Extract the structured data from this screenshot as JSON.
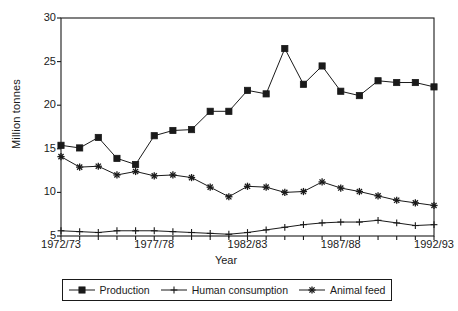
{
  "chart_data": {
    "type": "line",
    "title": "",
    "xlabel": "Year",
    "ylabel": "Million tonnes",
    "ylim": [
      5,
      30
    ],
    "yticks": [
      5,
      10,
      15,
      20,
      25,
      30
    ],
    "grid": false,
    "legend_position": "bottom",
    "x": [
      "1972/73",
      "1973/74",
      "1974/75",
      "1975/76",
      "1976/77",
      "1977/78",
      "1978/79",
      "1979/80",
      "1980/81",
      "1981/82",
      "1982/83",
      "1983/84",
      "1984/85",
      "1985/86",
      "1986/87",
      "1987/88",
      "1988/89",
      "1989/90",
      "1990/91",
      "1991/92",
      "1992/93"
    ],
    "xtick_labels": [
      "1972/73",
      "1977/78",
      "1982/83",
      "1987/88",
      "1992/93"
    ],
    "xtick_indices": [
      0,
      5,
      10,
      15,
      20
    ],
    "series": [
      {
        "name": "Production",
        "marker": "square",
        "color": "#1a1a1a",
        "values": [
          15.4,
          15.1,
          16.3,
          13.9,
          13.2,
          16.5,
          17.1,
          17.2,
          19.3,
          19.3,
          21.7,
          21.3,
          26.5,
          22.4,
          24.5,
          21.6,
          21.1,
          22.8,
          22.6,
          22.6,
          22.1
        ]
      },
      {
        "name": "Human consumption",
        "marker": "plus",
        "color": "#1a1a1a",
        "values": [
          5.6,
          5.5,
          5.4,
          5.6,
          5.6,
          5.6,
          5.5,
          5.4,
          5.3,
          5.2,
          5.4,
          5.7,
          6.0,
          6.3,
          6.5,
          6.6,
          6.6,
          6.8,
          6.5,
          6.2,
          6.3
        ]
      },
      {
        "name": "Animal feed",
        "marker": "asterisk",
        "color": "#1a1a1a",
        "values": [
          14.1,
          12.9,
          13.0,
          12.0,
          12.4,
          11.9,
          12.0,
          11.7,
          10.6,
          9.5,
          10.7,
          10.6,
          10.0,
          10.1,
          11.2,
          10.5,
          10.1,
          9.6,
          9.1,
          8.8,
          8.5
        ]
      }
    ]
  },
  "axes": {
    "ylabel": "Million tonnes",
    "xlabel": "Year"
  },
  "legend": {
    "entries": [
      {
        "label": "Production",
        "marker": "square"
      },
      {
        "label": "Human consumption",
        "marker": "plus"
      },
      {
        "label": "Animal feed",
        "marker": "asterisk"
      }
    ]
  },
  "colors": {
    "ink": "#1a1a1a",
    "background": "#ffffff"
  }
}
